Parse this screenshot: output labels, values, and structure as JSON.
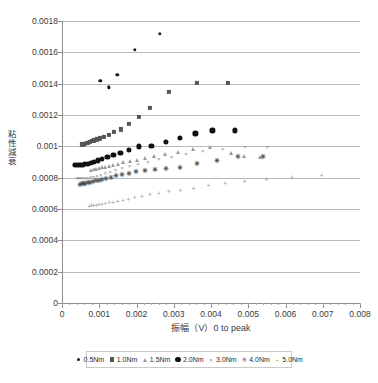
{
  "chart_data": {
    "type": "scatter",
    "title": "",
    "xlabel": "振幅（V）0 to peak",
    "ylabel": "粘性減衰",
    "xlim": [
      0,
      0.008
    ],
    "ylim": [
      0,
      0.0018
    ],
    "grid": true,
    "legend_position": "bottom",
    "x_ticks": [
      "0",
      "0.001",
      "0.002",
      "0.003",
      "0.004",
      "0.005",
      "0.006",
      "0.007",
      "0.008"
    ],
    "x_tick_values": [
      0,
      0.001,
      0.002,
      0.003,
      0.004,
      0.005,
      0.006,
      0.007,
      0.008
    ],
    "y_ticks": [
      "0",
      "0.0002",
      "0.0004",
      "0.0006",
      "0.0008",
      "0.001",
      "0.0012",
      "0.0014",
      "0.0016",
      "0.0018"
    ],
    "y_tick_values": [
      0,
      0.0002,
      0.0004,
      0.0006,
      0.0008,
      0.001,
      0.0012,
      0.0014,
      0.0016,
      0.0018
    ],
    "series": [
      {
        "name": "0.5Nm",
        "marker": "small-filled-circle",
        "color": "#1a1a1a",
        "points": [
          [
            0.00103,
            0.00142
          ],
          [
            0.00126,
            0.001378
          ],
          [
            0.00148,
            0.001458
          ],
          [
            0.00196,
            0.001617
          ],
          [
            0.00262,
            0.001717
          ]
        ]
      },
      {
        "name": "1.0Nm",
        "marker": "filled-square",
        "color": "#555555",
        "points": [
          [
            0.00055,
            0.001012
          ],
          [
            0.00062,
            0.001016
          ],
          [
            0.00068,
            0.001022
          ],
          [
            0.00074,
            0.001028
          ],
          [
            0.0008,
            0.001033
          ],
          [
            0.00086,
            0.001038
          ],
          [
            0.00093,
            0.001044
          ],
          [
            0.00102,
            0.001051
          ],
          [
            0.00112,
            0.001058
          ],
          [
            0.00125,
            0.001073
          ],
          [
            0.0014,
            0.00109
          ],
          [
            0.00158,
            0.001108
          ],
          [
            0.0018,
            0.001143
          ],
          [
            0.00207,
            0.001186
          ],
          [
            0.00236,
            0.001243
          ],
          [
            0.00288,
            0.001349
          ],
          [
            0.00363,
            0.001404
          ],
          [
            0.00446,
            0.001405
          ]
        ]
      },
      {
        "name": "1.5Nm",
        "marker": "triangle",
        "color": "#9a9a9a",
        "points": [
          [
            0.00078,
            0.000852
          ],
          [
            0.00085,
            0.000855
          ],
          [
            0.00092,
            0.000858
          ],
          [
            0.00099,
            0.000861
          ],
          [
            0.00107,
            0.000866
          ],
          [
            0.00116,
            0.000871
          ],
          [
            0.00126,
            0.000876
          ],
          [
            0.00137,
            0.000882
          ],
          [
            0.0015,
            0.000889
          ],
          [
            0.00165,
            0.000897
          ],
          [
            0.00182,
            0.000905
          ],
          [
            0.00201,
            0.000914
          ],
          [
            0.00223,
            0.000926
          ],
          [
            0.00248,
            0.000938
          ],
          [
            0.00277,
            0.000952
          ],
          [
            0.00311,
            0.000966
          ],
          [
            0.00351,
            0.000983
          ],
          [
            0.00398,
            0.000996
          ],
          [
            0.00454,
            0.000958
          ],
          [
            0.00489,
            0.000938
          ],
          [
            0.00531,
            0.00093
          ]
        ]
      },
      {
        "name": "2.0Nm",
        "marker": "large-filled-circle",
        "color": "#111111",
        "points": [
          [
            0.00035,
            0.000879
          ],
          [
            0.0004,
            0.000879
          ],
          [
            0.00045,
            0.00088
          ],
          [
            0.0005,
            0.000882
          ],
          [
            0.00056,
            0.000884
          ],
          [
            0.00062,
            0.000887
          ],
          [
            0.00069,
            0.00089
          ],
          [
            0.00077,
            0.000895
          ],
          [
            0.00086,
            0.000902
          ],
          [
            0.00096,
            0.00091
          ],
          [
            0.00108,
            0.00092
          ],
          [
            0.00122,
            0.000932
          ],
          [
            0.00138,
            0.000944
          ],
          [
            0.00157,
            0.000958
          ],
          [
            0.0018,
            0.000977
          ],
          [
            0.00207,
            0.000999
          ],
          [
            0.0024,
            0.001004
          ],
          [
            0.0028,
            0.00103
          ],
          [
            0.00317,
            0.001055
          ],
          [
            0.00358,
            0.001083
          ],
          [
            0.00404,
            0.001102
          ],
          [
            0.00465,
            0.001102
          ]
        ]
      },
      {
        "name": "3.0Nm",
        "marker": "x-cross",
        "color": "#8d8d8d",
        "points": [
          [
            0.0004,
            0.000797
          ],
          [
            0.00044,
            0.000797
          ],
          [
            0.00048,
            0.000798
          ],
          [
            0.00053,
            0.000798
          ],
          [
            0.00058,
            0.000799
          ],
          [
            0.00064,
            0.0008
          ],
          [
            0.0007,
            0.000801
          ],
          [
            0.00077,
            0.000803
          ],
          [
            0.00085,
            0.000806
          ],
          [
            0.00094,
            0.00081
          ],
          [
            0.00104,
            0.000818
          ],
          [
            0.00116,
            0.000827
          ],
          [
            0.00129,
            0.000838
          ],
          [
            0.00144,
            0.00085
          ],
          [
            0.00161,
            0.000862
          ],
          [
            0.00181,
            0.000875
          ],
          [
            0.00204,
            0.000888
          ],
          [
            0.0023,
            0.000901
          ],
          [
            0.0026,
            0.000916
          ],
          [
            0.00294,
            0.000931
          ],
          [
            0.00333,
            0.000948
          ],
          [
            0.00378,
            0.000968
          ],
          [
            0.00431,
            0.000983
          ],
          [
            0.00491,
            0.000993
          ],
          [
            0.00551,
            0.000998
          ]
        ]
      },
      {
        "name": "4.0Nm",
        "marker": "star-asterisk",
        "color": "#4a4a4a",
        "points": [
          [
            0.00048,
            0.000755
          ],
          [
            0.00053,
            0.000757
          ],
          [
            0.00058,
            0.000759
          ],
          [
            0.00063,
            0.000761
          ],
          [
            0.00069,
            0.000764
          ],
          [
            0.00075,
            0.000767
          ],
          [
            0.00082,
            0.000771
          ],
          [
            0.0009,
            0.000776
          ],
          [
            0.00098,
            0.000781
          ],
          [
            0.00108,
            0.000787
          ],
          [
            0.00119,
            0.000793
          ],
          [
            0.00131,
            0.0008
          ],
          [
            0.00145,
            0.000808
          ],
          [
            0.00161,
            0.000816
          ],
          [
            0.00179,
            0.000826
          ],
          [
            0.00199,
            0.000833
          ],
          [
            0.00222,
            0.00084
          ],
          [
            0.00249,
            0.000849
          ],
          [
            0.0028,
            0.000857
          ],
          [
            0.00317,
            0.000864
          ],
          [
            0.00362,
            0.000888
          ],
          [
            0.00415,
            0.000908
          ],
          [
            0.00472,
            0.00093
          ],
          [
            0.0054,
            0.000932
          ]
        ]
      },
      {
        "name": "5.0Nm",
        "marker": "plus",
        "color": "#9b9b9b",
        "points": [
          [
            0.00073,
            0.000622
          ],
          [
            0.00079,
            0.000624
          ],
          [
            0.00085,
            0.000626
          ],
          [
            0.00092,
            0.000628
          ],
          [
            0.00099,
            0.000631
          ],
          [
            0.00107,
            0.000634
          ],
          [
            0.00116,
            0.000638
          ],
          [
            0.00126,
            0.000642
          ],
          [
            0.00137,
            0.000647
          ],
          [
            0.00149,
            0.000652
          ],
          [
            0.00163,
            0.000659
          ],
          [
            0.00178,
            0.000666
          ],
          [
            0.00195,
            0.000674
          ],
          [
            0.00214,
            0.000683
          ],
          [
            0.00236,
            0.000693
          ],
          [
            0.0026,
            0.000703
          ],
          [
            0.00287,
            0.000713
          ],
          [
            0.00318,
            0.000724
          ],
          [
            0.00353,
            0.000737
          ],
          [
            0.00393,
            0.000751
          ],
          [
            0.00438,
            0.000765
          ],
          [
            0.0049,
            0.000779
          ],
          [
            0.00549,
            0.000791
          ],
          [
            0.00617,
            0.000802
          ],
          [
            0.00697,
            0.000817
          ]
        ]
      }
    ]
  }
}
